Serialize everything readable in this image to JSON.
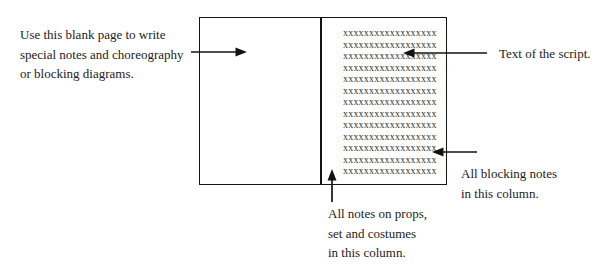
{
  "figure": {
    "background_color": "#ffffff",
    "ink_color": "#1c1c1c",
    "line_color": "#131313"
  },
  "book": {
    "script_lines": [
      "xxxxxxxxxxxxxxxxxx",
      "xxxxxxxxxxxxxxxxxx",
      "xxxxxxxxxxxxxxxxxx",
      "xxxxxxxxxxxxxxxxxx",
      "xxxxxxxxxxxxxxxxxx",
      "xxxxxxxxxxxxxxxxxx",
      "xxxxxxxxxxxxxxxxxx",
      "xxxxxxxxxxxxxxxxxx",
      "xxxxxxxxxxxxxxxxxx",
      "xxxxxxxxxxxxxxxxxx",
      "xxxxxxxxxxxxxxxxxx",
      "xxxxxxxxxxxxxxxxxx",
      "xxxxxxxxxxxxxxxxxx"
    ]
  },
  "annotations": {
    "blank_page_note": {
      "lines": [
        "Use this blank page to write",
        "special notes and choreography",
        "or blocking diagrams."
      ]
    },
    "script_text_note": {
      "label": "Text of the script."
    },
    "blocking_notes_note": {
      "lines": [
        "All blocking notes",
        "in this column."
      ]
    },
    "props_note": {
      "lines": [
        "All notes on props,",
        "set and costumes",
        "in this column."
      ]
    }
  }
}
